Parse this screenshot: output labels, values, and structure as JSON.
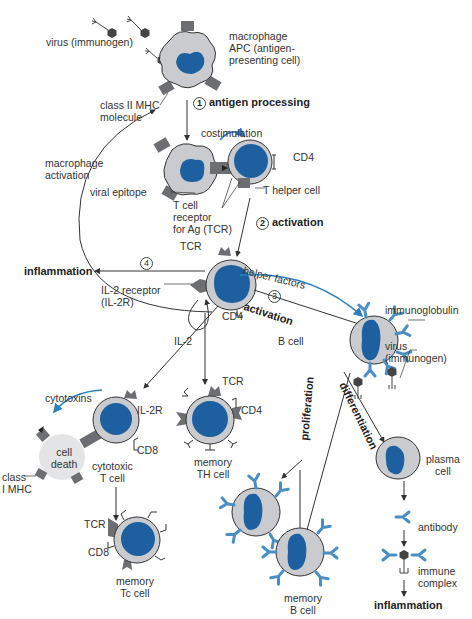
{
  "colors": {
    "nucleus": "#1e5fa0",
    "cytoplasm": "#c9cbcf",
    "receptor": "#6d6e71",
    "antibody": "#4a8ec4",
    "arrow_blue": "#2f7fc0",
    "line": "#333333"
  },
  "labels": {
    "virus_top": "virus (immunogen)",
    "macrophage": [
      "macrophage",
      "APC (antigen-",
      "presenting cell)"
    ],
    "class2_mhc": [
      "class II MHC",
      "molecule"
    ],
    "step1_num": "1",
    "step1": "antigen processing",
    "costimulation": "costimulation",
    "cd4_th": "CD4",
    "t_helper": "T helper cell",
    "macrophage_activation": [
      "macrophage",
      "activation"
    ],
    "viral_epitope": "viral epitope",
    "tcr_full": [
      "T cell",
      "receptor",
      "for Ag (TCR)"
    ],
    "step2_num": "2",
    "step2": "activation",
    "tcr_center": "TCR",
    "step4_num": "4",
    "inflammation_left": "inflammation",
    "il2_receptor": [
      "IL-2 receptor",
      "(IL-2R)"
    ],
    "cd4_center": "CD4",
    "helper_factors": "helper factors",
    "step3_num": "3",
    "step3": "activation",
    "immunoglobulin": "immunoglobulin",
    "b_cell": "B cell",
    "virus_b": [
      "virus",
      "(immunogen)"
    ],
    "il2": "IL-2",
    "cytotoxins": "cytotoxins",
    "il2r": "IL-2R",
    "cd8_ct": "CD8",
    "cell_death": [
      "cell",
      "death"
    ],
    "class1_mhc": [
      "class",
      "I MHC"
    ],
    "cytotoxic_t": [
      "cytotoxic",
      "T cell"
    ],
    "tcr_mth": "TCR",
    "cd4_mth": "CD4",
    "memory_th": [
      "memory",
      "TH cell"
    ],
    "proliferation": "proliferation",
    "differentiation": "differentiation",
    "plasma_cell": [
      "plasma",
      "cell"
    ],
    "tcr_mtc": "TCR",
    "cd8_mtc": "CD8",
    "memory_tc": [
      "memory",
      "Tc cell"
    ],
    "memory_b": [
      "memory",
      "B cell"
    ],
    "antibody": "antibody",
    "immune_complex": [
      "immune",
      "complex"
    ],
    "inflammation_bottom": "inflammation"
  }
}
